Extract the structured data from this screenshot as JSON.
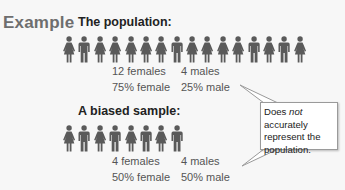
{
  "label": "Example",
  "population": {
    "heading": "The population:",
    "figures": [
      "female",
      "male",
      "female",
      "female",
      "female",
      "female",
      "female",
      "male",
      "female",
      "female",
      "female",
      "female",
      "male",
      "female",
      "male",
      "female"
    ],
    "stats": {
      "female_count": "12 females",
      "male_count": "4 males",
      "female_pct": "75% female",
      "male_pct": "25% male"
    }
  },
  "sample": {
    "heading": "A biased sample:",
    "figures": [
      "female",
      "male",
      "female",
      "male",
      "female",
      "male",
      "female",
      "male"
    ],
    "stats": {
      "female_count": "4 females",
      "male_count": "4 males",
      "female_pct": "50% female",
      "male_pct": "50% male"
    }
  },
  "callout": {
    "text_before": "Does ",
    "text_emphasis": "not",
    "text_after": " accurately represent the population."
  },
  "colors": {
    "figure": "#5a5a5a",
    "label": "#6e6e6e",
    "callout_border": "#9a9a9a"
  }
}
